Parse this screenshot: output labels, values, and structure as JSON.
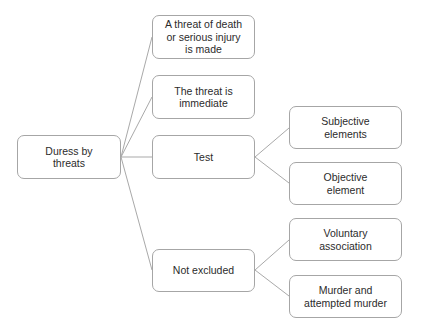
{
  "diagram": {
    "type": "tree",
    "root": {
      "id": "duress",
      "label": "Duress by threats"
    },
    "level1": [
      {
        "id": "threat-death",
        "label": "A threat of death or serious injury is made"
      },
      {
        "id": "threat-immediate",
        "label": "The threat is immediate"
      },
      {
        "id": "test",
        "label": "Test"
      },
      {
        "id": "not-excluded",
        "label": "Not excluded"
      }
    ],
    "level2": [
      {
        "id": "subjective",
        "parent": "test",
        "label": "Subjective elements"
      },
      {
        "id": "objective",
        "parent": "test",
        "label": "Objective element"
      },
      {
        "id": "voluntary",
        "parent": "not-excluded",
        "label": "Voluntary association"
      },
      {
        "id": "murder",
        "parent": "not-excluded",
        "label": "Murder and attempted murder"
      }
    ],
    "colors": {
      "border": "#a6a6a6",
      "connector": "#a9a9a9",
      "text": "#2b2b2b",
      "background": "#ffffff"
    }
  }
}
